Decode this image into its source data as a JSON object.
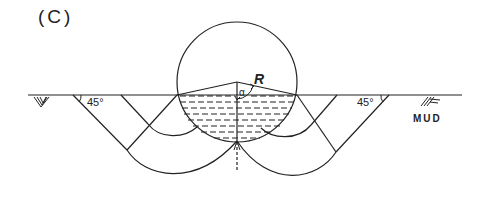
{
  "figure": {
    "panel_label": "(C)",
    "labels": {
      "radius": "R",
      "angle": "α",
      "angle_left": "45°",
      "angle_right": "45°",
      "material": "MUD"
    },
    "colors": {
      "line": "#222222",
      "background": "#ffffff"
    }
  }
}
